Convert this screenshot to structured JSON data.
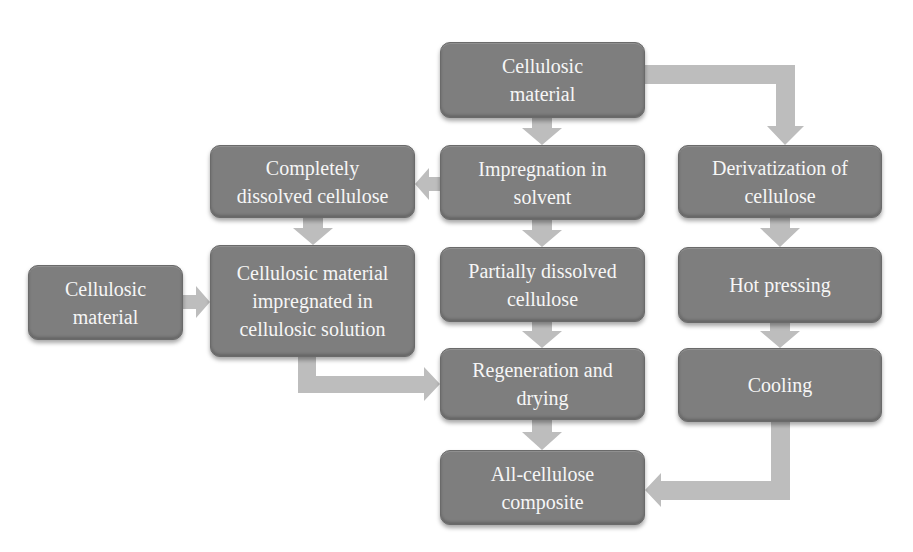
{
  "diagram": {
    "type": "flowchart",
    "colors": {
      "box_fill": "#7e7e7e",
      "box_text": "#f6f6f6",
      "arrow_fill": "#bdbdbd"
    },
    "nodes": {
      "cellulosic_material_top": "Cellulosic\nmaterial",
      "impregnation_in_solvent": "Impregnation in\nsolvent",
      "completely_dissolved_cellulose": "Completely\ndissolved cellulose",
      "derivatization_of_cellulose": "Derivatization of\ncellulose",
      "cellulosic_material_left": "Cellulosic\nmaterial",
      "cellulosic_material_impregnated": "Cellulosic material\nimpregnated in\ncellulosic solution",
      "partially_dissolved_cellulose": "Partially dissolved\ncellulose",
      "hot_pressing": "Hot pressing",
      "regeneration_and_drying": "Regeneration and\ndrying",
      "cooling": "Cooling",
      "all_cellulose_composite": "All-cellulose\ncomposite"
    },
    "edges": [
      {
        "from": "cellulosic_material_top",
        "to": "impregnation_in_solvent"
      },
      {
        "from": "cellulosic_material_top",
        "to": "derivatization_of_cellulose"
      },
      {
        "from": "impregnation_in_solvent",
        "to": "completely_dissolved_cellulose"
      },
      {
        "from": "impregnation_in_solvent",
        "to": "partially_dissolved_cellulose"
      },
      {
        "from": "completely_dissolved_cellulose",
        "to": "cellulosic_material_impregnated"
      },
      {
        "from": "cellulosic_material_left",
        "to": "cellulosic_material_impregnated"
      },
      {
        "from": "cellulosic_material_impregnated",
        "to": "regeneration_and_drying"
      },
      {
        "from": "partially_dissolved_cellulose",
        "to": "regeneration_and_drying"
      },
      {
        "from": "regeneration_and_drying",
        "to": "all_cellulose_composite"
      },
      {
        "from": "derivatization_of_cellulose",
        "to": "hot_pressing"
      },
      {
        "from": "hot_pressing",
        "to": "cooling"
      },
      {
        "from": "cooling",
        "to": "all_cellulose_composite"
      }
    ]
  }
}
